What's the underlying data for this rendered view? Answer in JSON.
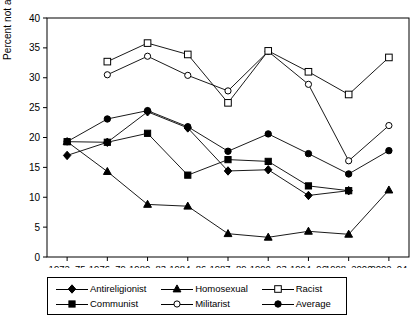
{
  "chart_data": {
    "type": "line",
    "title": "",
    "xlabel": "",
    "ylabel": "Percent not allowed",
    "ylim": [
      0,
      40
    ],
    "yticks": [
      0,
      5,
      10,
      15,
      20,
      25,
      30,
      35,
      40
    ],
    "grid": false,
    "legend_position": "bottom",
    "categories": [
      "1972–75",
      "1976–79",
      "1980–83",
      "1984–86",
      "1987–89",
      "1990–93",
      "1994–96",
      "1998–2000",
      "2002–04"
    ],
    "series": [
      {
        "name": "Antireligionist",
        "marker": "filled-diamond",
        "values": [
          17.0,
          19.2,
          24.3,
          21.6,
          14.4,
          14.6,
          10.3,
          11.1,
          null
        ]
      },
      {
        "name": "Communist",
        "marker": "filled-square",
        "values": [
          19.3,
          19.2,
          20.7,
          13.7,
          16.3,
          16.0,
          11.9,
          11.1,
          null
        ]
      },
      {
        "name": "Homosexual",
        "marker": "filled-triangle",
        "values": [
          19.3,
          14.3,
          8.8,
          8.5,
          3.9,
          3.3,
          4.3,
          3.8,
          11.2
        ]
      },
      {
        "name": "Militarist",
        "marker": "open-circle",
        "values": [
          null,
          30.5,
          33.6,
          30.4,
          27.8,
          34.4,
          28.9,
          16.1,
          22.0
        ]
      },
      {
        "name": "Racist",
        "marker": "open-square",
        "values": [
          null,
          32.7,
          35.8,
          33.9,
          25.8,
          34.5,
          31.0,
          27.2,
          33.4
        ]
      },
      {
        "name": "Average",
        "marker": "filled-circle",
        "values": [
          19.3,
          23.1,
          24.5,
          21.8,
          17.7,
          20.6,
          17.3,
          13.9,
          17.8
        ]
      }
    ]
  },
  "legend": {
    "entries": [
      {
        "label": "Antireligionist",
        "marker": "filled-diamond"
      },
      {
        "label": "Homosexual",
        "marker": "filled-triangle"
      },
      {
        "label": "Racist",
        "marker": "open-square"
      },
      {
        "label": "Communist",
        "marker": "filled-square"
      },
      {
        "label": "Militarist",
        "marker": "open-circle"
      },
      {
        "label": "Average",
        "marker": "filled-circle"
      }
    ]
  },
  "colors": {
    "line": "#000000",
    "axis": "#000000",
    "background": "#ffffff"
  }
}
